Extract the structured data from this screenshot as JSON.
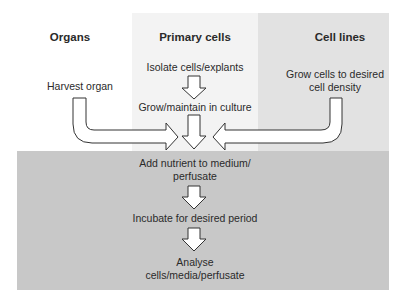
{
  "columns": {
    "organs": "Organs",
    "primary": "Primary cells",
    "cell_lines": "Cell lines"
  },
  "steps": {
    "harvest": "Harvest organ",
    "isolate": "Isolate cells/explants",
    "grow_maintain": "Grow/maintain in culture",
    "grow_cells_1": "Grow cells to desired",
    "grow_cells_2": "cell density",
    "add_nutrient_1": "Add nutrient to medium/",
    "add_nutrient_2": "perfusate",
    "incubate": "Incubate for desired period",
    "analyse_1": "Analyse",
    "analyse_2": "cells/media/perfusate"
  },
  "colors": {
    "primary_bg": "#f3f3f3",
    "cell_lines_bg": "#e2e2e2",
    "common_bg": "#c8c8c8"
  }
}
